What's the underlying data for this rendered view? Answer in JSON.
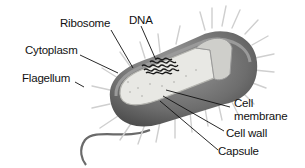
{
  "diagram": {
    "labels": {
      "ribosome": "Ribosome",
      "dna": "DNA",
      "cytoplasm": "Cytoplasm",
      "flagellum": "Flagellum",
      "cell_membrane_line1": "Cell",
      "cell_membrane_line2": "membrane",
      "cell_wall": "Cell wall",
      "capsule": "Capsule"
    },
    "colors": {
      "capsule_shade": "#6b6b6b",
      "cytoplasm_fill": "#e6e6e2",
      "dna": "#1a1a1a",
      "pili": "#d8d8d8",
      "text": "#111111"
    }
  }
}
